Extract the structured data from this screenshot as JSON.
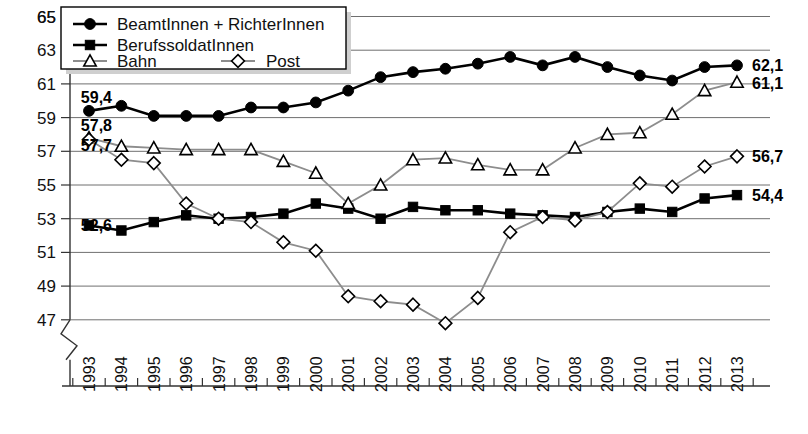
{
  "chart_data": {
    "type": "line",
    "title": "",
    "xlabel": "",
    "ylabel": "",
    "grid": true,
    "legend_position": "top-left",
    "axis_break": true,
    "ylim": [
      46,
      66
    ],
    "yticks": [
      47,
      49,
      51,
      53,
      55,
      57,
      59,
      61,
      63,
      65
    ],
    "categories": [
      "1993",
      "1994",
      "1995",
      "1996",
      "1997",
      "1998",
      "1999",
      "2000",
      "2001",
      "2002",
      "2003",
      "2004",
      "2005",
      "2006",
      "2007",
      "2008",
      "2009",
      "2010",
      "2011",
      "2012",
      "2013"
    ],
    "series": [
      {
        "name": "BeamtInnen + RichterInnen",
        "marker": "circle-filled",
        "color": "#000000",
        "values": [
          59.4,
          59.7,
          59.1,
          59.1,
          59.1,
          59.6,
          59.6,
          59.9,
          60.6,
          61.4,
          61.7,
          61.9,
          62.2,
          62.6,
          62.1,
          62.6,
          62.0,
          61.5,
          61.2,
          62.0,
          62.1
        ],
        "start_label": "59,4",
        "end_label": "62,1"
      },
      {
        "name": "BerufssoldatInnen",
        "marker": "square-filled",
        "color": "#000000",
        "values": [
          52.6,
          52.3,
          52.8,
          53.2,
          53.0,
          53.1,
          53.3,
          53.9,
          53.6,
          53.0,
          53.7,
          53.5,
          53.5,
          53.3,
          53.2,
          53.1,
          53.4,
          53.6,
          53.4,
          54.2,
          54.4
        ],
        "start_label": "52,6",
        "end_label": "54,4"
      },
      {
        "name": "Bahn",
        "marker": "triangle-open",
        "color": "#8d8d8d",
        "values": [
          57.8,
          57.3,
          57.2,
          57.1,
          57.1,
          57.1,
          56.4,
          55.7,
          53.9,
          55.0,
          56.5,
          56.6,
          56.2,
          55.9,
          55.9,
          57.2,
          58.0,
          58.1,
          59.2,
          60.6,
          61.1
        ],
        "start_label": "57,8",
        "end_label": "61,1"
      },
      {
        "name": "Post",
        "marker": "diamond-open",
        "color": "#8d8d8d",
        "values": [
          57.7,
          56.5,
          56.3,
          53.9,
          53.0,
          52.8,
          51.6,
          51.1,
          48.4,
          48.1,
          47.9,
          46.8,
          48.3,
          52.2,
          53.1,
          52.9,
          53.4,
          55.1,
          54.9,
          56.1,
          56.7
        ],
        "start_label": "57,7",
        "end_label": "56,7"
      }
    ],
    "edge_labels": {
      "left": [
        "59,4",
        "57,8",
        "57,7",
        "52,6"
      ],
      "right": [
        "62,1",
        "61,1",
        "56,7",
        "54,4"
      ]
    }
  },
  "legend": {
    "items": [
      {
        "label": "BeamtInnen + RichterInnen",
        "marker": "circle-filled"
      },
      {
        "label": "BerufssoldatInnen",
        "marker": "square-filled"
      },
      {
        "label": "Bahn",
        "marker": "triangle-open"
      },
      {
        "label": "Post",
        "marker": "diamond-open"
      }
    ]
  }
}
